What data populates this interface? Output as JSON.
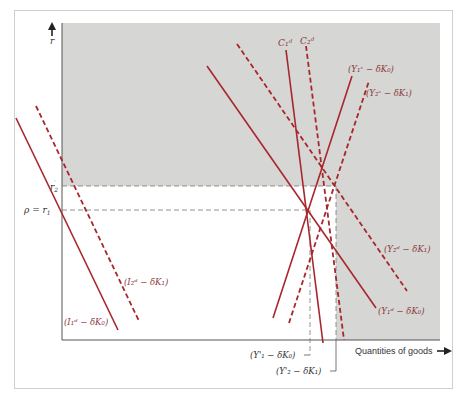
{
  "colors": {
    "curve": "#a8262c",
    "label": "#8b3a3e",
    "shade": "#d6d6d4",
    "axis": "#555555",
    "frame": "#cfcfcf",
    "guide": "#777777"
  },
  "axes": {
    "y_label": "r",
    "x_label": "Quantities of goods",
    "r2_label": "r'2",
    "r1_label": "ρ = r1"
  },
  "curves": [
    {
      "id": "I1",
      "label": "(I₁ᵈ − δK₀)",
      "style": "solid"
    },
    {
      "id": "I2",
      "label": "(I₂ᵈ − δK₁)",
      "style": "dashed"
    },
    {
      "id": "C1",
      "label": "C₁ᵈ",
      "style": "solid"
    },
    {
      "id": "C2",
      "label": "C₂ᵈ",
      "style": "dashed"
    },
    {
      "id": "Y1s",
      "label": "(Y₁ˢ − δK₀)",
      "style": "solid"
    },
    {
      "id": "Y2s",
      "label": "(Y₂ˢ − δK₁)",
      "style": "dashed"
    },
    {
      "id": "Y1d",
      "label": "(Y₁ᵈ − δK₀)",
      "style": "solid"
    },
    {
      "id": "Y2d",
      "label": "(Y₂ᵈ − δK₁)",
      "style": "dashed"
    }
  ],
  "labels": {
    "c1": "C₁ᵈ",
    "c2": "C₂ᵈ",
    "y1s_top": "(Y₁ˢ − δK₀)",
    "y2s_top": "(Y₂ˢ − δK₁)",
    "y2d": "(Y₂ᵈ − δK₁)",
    "y1d": "(Y₁ᵈ − δK₀)",
    "i2": "(I₂ᵈ − δK₁)",
    "i1": "(I₁ᵈ − δK₀)",
    "y1s_bottom": "(Y'₁ − δK₀)",
    "y2s_bottom": "(Y'₂ − δK₁)"
  }
}
